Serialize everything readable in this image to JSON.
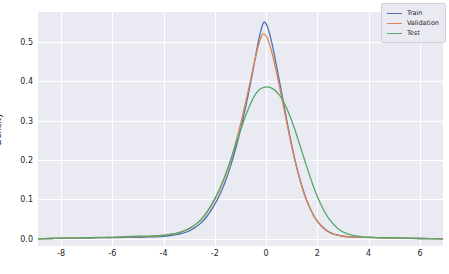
{
  "chart_data": {
    "type": "line",
    "title": "",
    "subtitle": "",
    "xlabel": "",
    "ylabel": "Density",
    "xlim": [
      -8.9,
      6.9
    ],
    "ylim": [
      -0.018,
      0.575
    ],
    "xticks": [
      "-8",
      "-6",
      "-4",
      "-2",
      "0",
      "2",
      "4",
      "6"
    ],
    "xtick_values": [
      -8,
      -6,
      -4,
      -2,
      0,
      2,
      4,
      6
    ],
    "yticks": [
      "0.0",
      "0.1",
      "0.2",
      "0.3",
      "0.4",
      "0.5"
    ],
    "ytick_values": [
      0.0,
      0.1,
      0.2,
      0.3,
      0.4,
      0.5
    ],
    "grid": true,
    "grid_color": "#ffffff",
    "axes_background": "#eaeaf2",
    "legend_position": "upper right",
    "series": [
      {
        "name": "Train",
        "color": "#4c72b0",
        "peak_x": -0.1,
        "peak_y": 0.548,
        "x": [
          -8.9,
          -8.4,
          -8.0,
          -7.5,
          -7.0,
          -6.5,
          -6.0,
          -5.5,
          -5.0,
          -4.6,
          -4.2,
          -3.8,
          -3.4,
          -3.0,
          -2.6,
          -2.3,
          -2.0,
          -1.8,
          -1.6,
          -1.4,
          -1.2,
          -1.0,
          -0.8,
          -0.6,
          -0.45,
          -0.3,
          -0.2,
          -0.1,
          0.0,
          0.1,
          0.25,
          0.4,
          0.6,
          0.8,
          1.0,
          1.2,
          1.4,
          1.6,
          1.9,
          2.2,
          2.5,
          2.9,
          3.3,
          3.8,
          4.3,
          4.8,
          5.4,
          6.0,
          6.9
        ],
        "y": [
          0.0,
          0.001,
          0.002,
          0.002,
          0.002,
          0.003,
          0.003,
          0.004,
          0.004,
          0.005,
          0.006,
          0.008,
          0.012,
          0.02,
          0.037,
          0.058,
          0.088,
          0.113,
          0.144,
          0.182,
          0.226,
          0.277,
          0.334,
          0.397,
          0.449,
          0.501,
          0.529,
          0.548,
          0.545,
          0.528,
          0.489,
          0.44,
          0.372,
          0.302,
          0.237,
          0.18,
          0.133,
          0.095,
          0.054,
          0.03,
          0.016,
          0.008,
          0.005,
          0.004,
          0.003,
          0.002,
          0.002,
          0.001,
          0.0
        ]
      },
      {
        "name": "Validation",
        "color": "#dd8452",
        "peak_x": -0.12,
        "peak_y": 0.52,
        "x": [
          -8.9,
          -8.4,
          -8.0,
          -7.5,
          -7.0,
          -6.5,
          -6.0,
          -5.5,
          -5.0,
          -4.6,
          -4.2,
          -3.8,
          -3.4,
          -3.0,
          -2.6,
          -2.3,
          -2.0,
          -1.8,
          -1.6,
          -1.4,
          -1.2,
          -1.0,
          -0.8,
          -0.6,
          -0.45,
          -0.3,
          -0.2,
          -0.12,
          0.0,
          0.1,
          0.25,
          0.4,
          0.6,
          0.8,
          1.0,
          1.2,
          1.4,
          1.6,
          1.9,
          2.2,
          2.5,
          2.9,
          3.3,
          3.8,
          4.3,
          4.8,
          5.4,
          6.0,
          6.9
        ],
        "y": [
          0.0,
          0.001,
          0.002,
          0.002,
          0.003,
          0.003,
          0.004,
          0.005,
          0.006,
          0.006,
          0.008,
          0.011,
          0.016,
          0.026,
          0.045,
          0.068,
          0.1,
          0.126,
          0.158,
          0.196,
          0.241,
          0.291,
          0.346,
          0.405,
          0.45,
          0.49,
          0.511,
          0.52,
          0.514,
          0.5,
          0.466,
          0.423,
          0.361,
          0.296,
          0.233,
          0.178,
          0.131,
          0.094,
          0.054,
          0.029,
          0.015,
          0.008,
          0.005,
          0.004,
          0.003,
          0.002,
          0.002,
          0.001,
          0.0
        ]
      },
      {
        "name": "Test",
        "color": "#55a868",
        "peak_x": 0.05,
        "peak_y": 0.385,
        "x": [
          -8.9,
          -8.4,
          -8.0,
          -7.5,
          -7.0,
          -6.5,
          -6.0,
          -5.5,
          -5.0,
          -4.6,
          -4.2,
          -3.8,
          -3.4,
          -3.0,
          -2.6,
          -2.3,
          -2.0,
          -1.8,
          -1.6,
          -1.4,
          -1.2,
          -1.0,
          -0.8,
          -0.6,
          -0.4,
          -0.2,
          0.05,
          0.3,
          0.5,
          0.7,
          0.9,
          1.1,
          1.3,
          1.5,
          1.8,
          2.1,
          2.4,
          2.8,
          3.2,
          3.7,
          4.2,
          4.8,
          5.4,
          6.0,
          6.9
        ],
        "y": [
          0.0,
          0.001,
          0.002,
          0.002,
          0.003,
          0.004,
          0.004,
          0.006,
          0.007,
          0.007,
          0.008,
          0.011,
          0.016,
          0.026,
          0.045,
          0.069,
          0.102,
          0.129,
          0.161,
          0.197,
          0.236,
          0.275,
          0.312,
          0.344,
          0.368,
          0.381,
          0.385,
          0.379,
          0.366,
          0.345,
          0.316,
          0.281,
          0.241,
          0.2,
          0.141,
          0.092,
          0.056,
          0.026,
          0.012,
          0.006,
          0.004,
          0.003,
          0.002,
          0.001,
          0.0
        ]
      }
    ]
  },
  "legend": {
    "items": [
      {
        "label": "Train",
        "color": "#4c72b0"
      },
      {
        "label": "Validation",
        "color": "#dd8452"
      },
      {
        "label": "Test",
        "color": "#55a868"
      }
    ]
  },
  "axis": {
    "ylabel": "Density"
  }
}
